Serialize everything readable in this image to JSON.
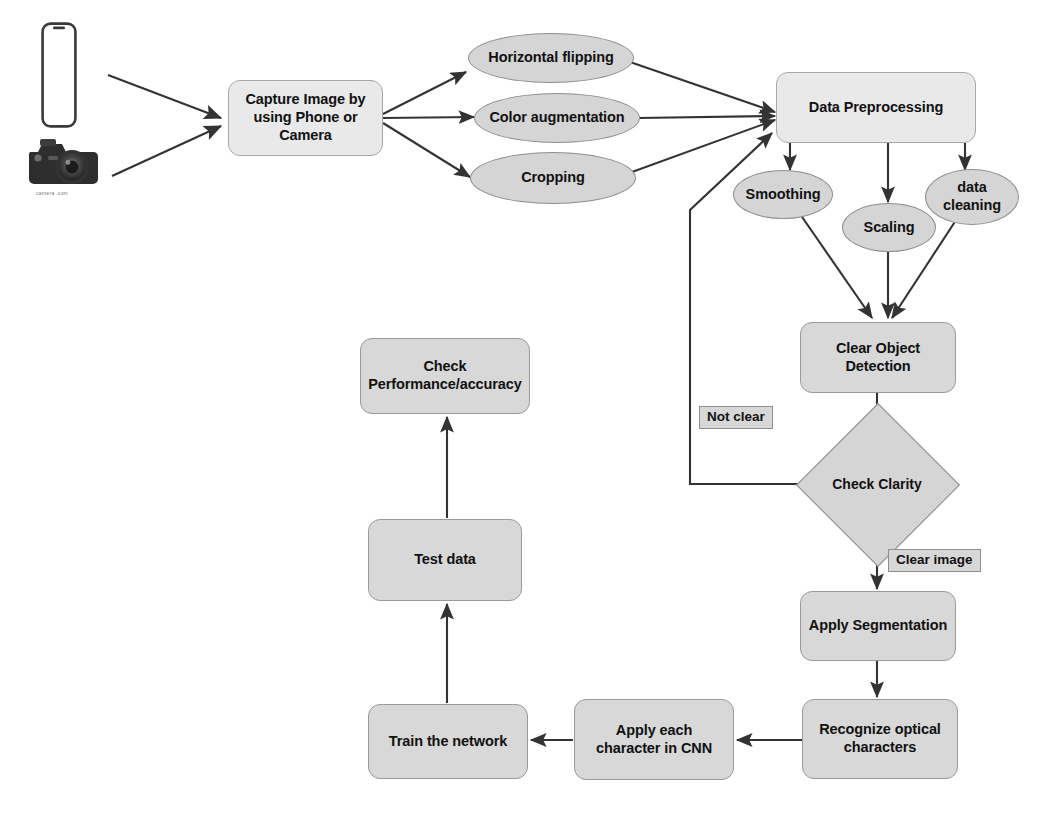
{
  "diagram": {
    "colors": {
      "box_fill": "#d8d8d8",
      "box_fill_light": "#e9e9e9",
      "ellipse_fill": "#d5d5d5",
      "stroke": "#8e8e8e",
      "edge": "#3a3a3a",
      "text": "#111111",
      "label_fill": "#d7d7d7"
    },
    "icons": [
      {
        "name": "smartphone-icon",
        "caption": ""
      },
      {
        "name": "dslr-camera-icon",
        "caption": "camera .com"
      }
    ],
    "nodes": [
      {
        "id": "capture",
        "label": "Capture Image by\nusing Phone or\nCamera",
        "shape": "box"
      },
      {
        "id": "hflip",
        "label": "Horizontal flipping",
        "shape": "ellipse"
      },
      {
        "id": "coloraug",
        "label": "Color augmentation",
        "shape": "ellipse"
      },
      {
        "id": "cropping",
        "label": "Cropping",
        "shape": "ellipse"
      },
      {
        "id": "preprocess",
        "label": "Data Preprocessing",
        "shape": "box"
      },
      {
        "id": "smoothing",
        "label": "Smoothing",
        "shape": "ellipse"
      },
      {
        "id": "scaling",
        "label": "Scaling",
        "shape": "ellipse"
      },
      {
        "id": "datacleaning",
        "label": "data\ncleaning",
        "shape": "ellipse"
      },
      {
        "id": "cleardetect",
        "label": "Clear Object\nDetection",
        "shape": "box"
      },
      {
        "id": "checkclarity",
        "label": "Check Clarity",
        "shape": "diamond"
      },
      {
        "id": "segmentation",
        "label": "Apply Segmentation",
        "shape": "box"
      },
      {
        "id": "recognize",
        "label": "Recognize optical\ncharacters",
        "shape": "box"
      },
      {
        "id": "applychar",
        "label": "Apply each\ncharacter in CNN",
        "shape": "box"
      },
      {
        "id": "train",
        "label": "Train the network",
        "shape": "box"
      },
      {
        "id": "testdata",
        "label": "Test data",
        "shape": "box"
      },
      {
        "id": "checkperf",
        "label": "Check\nPerformance/accuracy",
        "shape": "box"
      }
    ],
    "edge_labels": [
      {
        "id": "notclear",
        "label": "Not clear"
      },
      {
        "id": "clearimage",
        "label": "Clear image"
      }
    ],
    "edges": [
      {
        "from": "smartphone-icon",
        "to": "capture"
      },
      {
        "from": "dslr-camera-icon",
        "to": "capture"
      },
      {
        "from": "capture",
        "to": "hflip"
      },
      {
        "from": "capture",
        "to": "coloraug"
      },
      {
        "from": "capture",
        "to": "cropping"
      },
      {
        "from": "hflip",
        "to": "preprocess"
      },
      {
        "from": "coloraug",
        "to": "preprocess"
      },
      {
        "from": "cropping",
        "to": "preprocess"
      },
      {
        "from": "preprocess",
        "to": "smoothing"
      },
      {
        "from": "preprocess",
        "to": "scaling"
      },
      {
        "from": "preprocess",
        "to": "datacleaning"
      },
      {
        "from": "smoothing",
        "to": "cleardetect"
      },
      {
        "from": "scaling",
        "to": "cleardetect"
      },
      {
        "from": "datacleaning",
        "to": "cleardetect"
      },
      {
        "from": "cleardetect",
        "to": "checkclarity"
      },
      {
        "from": "checkclarity",
        "to": "preprocess",
        "label": "Not clear"
      },
      {
        "from": "checkclarity",
        "to": "segmentation",
        "label": "Clear image"
      },
      {
        "from": "segmentation",
        "to": "recognize"
      },
      {
        "from": "recognize",
        "to": "applychar"
      },
      {
        "from": "applychar",
        "to": "train"
      },
      {
        "from": "train",
        "to": "testdata"
      },
      {
        "from": "testdata",
        "to": "checkperf"
      }
    ]
  }
}
